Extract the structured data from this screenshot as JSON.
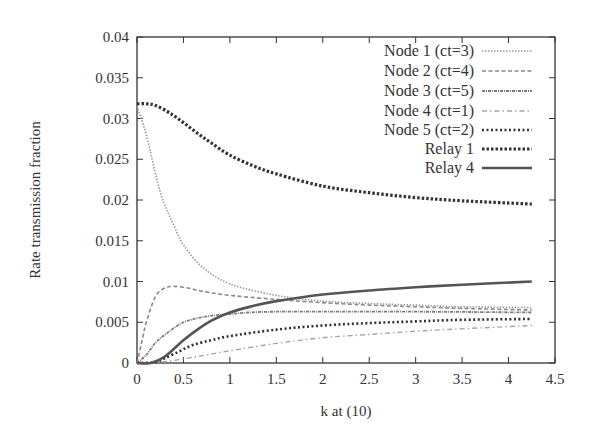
{
  "chart_data": {
    "type": "line",
    "title": "",
    "xlabel": "k at (10)",
    "ylabel": "Rate transmission fraction",
    "xlim": [
      0,
      4.5
    ],
    "ylim": [
      0,
      0.04
    ],
    "xticks": [
      "0",
      "0.5",
      "1",
      "1.5",
      "2",
      "2.5",
      "3",
      "3.5",
      "4",
      "4.5"
    ],
    "yticks": [
      "0",
      "0.005",
      "0.01",
      "0.015",
      "0.02",
      "0.025",
      "0.03",
      "0.035",
      "0.04"
    ],
    "grid": false,
    "legend_position": "top-right",
    "series": [
      {
        "name": "Node 1 (ct=3)",
        "style": "dotted-fine",
        "color": "#9a9a9a",
        "points": [
          [
            0,
            0.0315
          ],
          [
            0.1,
            0.028
          ],
          [
            0.25,
            0.021
          ],
          [
            0.4,
            0.0168
          ],
          [
            0.5,
            0.0145
          ],
          [
            0.7,
            0.0118
          ],
          [
            1,
            0.0097
          ],
          [
            1.5,
            0.0083
          ],
          [
            2,
            0.0076
          ],
          [
            2.5,
            0.0073
          ],
          [
            3,
            0.0071
          ],
          [
            3.5,
            0.0069
          ],
          [
            4.25,
            0.0068
          ]
        ]
      },
      {
        "name": "Node 2 (ct=4)",
        "style": "dashed",
        "color": "#8a8a8a",
        "points": [
          [
            0,
            0
          ],
          [
            0.05,
            0.0025
          ],
          [
            0.1,
            0.005
          ],
          [
            0.2,
            0.0082
          ],
          [
            0.3,
            0.0092
          ],
          [
            0.4,
            0.0094
          ],
          [
            0.55,
            0.0092
          ],
          [
            0.7,
            0.0088
          ],
          [
            1,
            0.0083
          ],
          [
            1.5,
            0.0078
          ],
          [
            2,
            0.0074
          ],
          [
            2.5,
            0.0071
          ],
          [
            3,
            0.0069
          ],
          [
            3.5,
            0.0067
          ],
          [
            4.25,
            0.0065
          ]
        ]
      },
      {
        "name": "Node 3 (ct=5)",
        "style": "dash-dot-dense",
        "color": "#7a7a7a",
        "points": [
          [
            0,
            0
          ],
          [
            0.1,
            0.001
          ],
          [
            0.2,
            0.0025
          ],
          [
            0.35,
            0.0039
          ],
          [
            0.5,
            0.005
          ],
          [
            0.65,
            0.0055
          ],
          [
            0.8,
            0.0058
          ],
          [
            1,
            0.006
          ],
          [
            1.2,
            0.0062
          ],
          [
            1.5,
            0.0063
          ],
          [
            2,
            0.0063
          ],
          [
            3,
            0.0063
          ],
          [
            4.25,
            0.0062
          ]
        ]
      },
      {
        "name": "Node 4 (ct=1)",
        "style": "dash-dot",
        "color": "#a5a5a5",
        "points": [
          [
            0,
            0
          ],
          [
            0.25,
            0.0001
          ],
          [
            0.5,
            0.0005
          ],
          [
            0.75,
            0.001
          ],
          [
            1,
            0.0015
          ],
          [
            1.5,
            0.0024
          ],
          [
            2,
            0.0031
          ],
          [
            2.5,
            0.0035
          ],
          [
            3,
            0.0039
          ],
          [
            3.5,
            0.0042
          ],
          [
            4.25,
            0.0046
          ]
        ]
      },
      {
        "name": "Node 5 (ct=2)",
        "style": "dotted-bold",
        "color": "#333333",
        "points": [
          [
            0,
            0
          ],
          [
            0.2,
            0.0001
          ],
          [
            0.3,
            0.0006
          ],
          [
            0.45,
            0.0014
          ],
          [
            0.6,
            0.0022
          ],
          [
            0.8,
            0.0028
          ],
          [
            1,
            0.0033
          ],
          [
            1.5,
            0.0041
          ],
          [
            2,
            0.0046
          ],
          [
            2.5,
            0.0049
          ],
          [
            3,
            0.0051
          ],
          [
            3.5,
            0.0053
          ],
          [
            4.25,
            0.0054
          ]
        ]
      },
      {
        "name": "Relay 1",
        "style": "dotted-heavy",
        "color": "#333333",
        "points": [
          [
            0,
            0.0318
          ],
          [
            0.1,
            0.0318
          ],
          [
            0.2,
            0.0316
          ],
          [
            0.35,
            0.0307
          ],
          [
            0.5,
            0.0295
          ],
          [
            0.65,
            0.0282
          ],
          [
            0.8,
            0.027
          ],
          [
            1,
            0.0255
          ],
          [
            1.25,
            0.0242
          ],
          [
            1.5,
            0.0232
          ],
          [
            2,
            0.0217
          ],
          [
            2.5,
            0.0209
          ],
          [
            3,
            0.0203
          ],
          [
            3.5,
            0.0199
          ],
          [
            4.25,
            0.0195
          ]
        ]
      },
      {
        "name": "Relay 4",
        "style": "solid",
        "color": "#555555",
        "points": [
          [
            0,
            0
          ],
          [
            0.15,
            0
          ],
          [
            0.3,
            0.0008
          ],
          [
            0.5,
            0.0028
          ],
          [
            0.65,
            0.0041
          ],
          [
            0.8,
            0.0052
          ],
          [
            1,
            0.0062
          ],
          [
            1.25,
            0.007
          ],
          [
            1.5,
            0.0076
          ],
          [
            2,
            0.0084
          ],
          [
            2.5,
            0.0089
          ],
          [
            3,
            0.0093
          ],
          [
            3.5,
            0.0096
          ],
          [
            4.25,
            0.01
          ]
        ]
      }
    ]
  }
}
